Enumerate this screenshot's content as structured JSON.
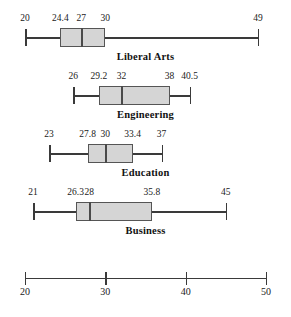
{
  "header": {
    "clipped_text": ""
  },
  "chart_data": {
    "type": "boxplot",
    "title": "",
    "xlabel": "",
    "ylabel": "",
    "xlim": [
      20,
      50
    ],
    "grid": false,
    "legend": "none",
    "axis": {
      "ticks": [
        20,
        30,
        40,
        50
      ],
      "tick_labels": [
        "20",
        "30",
        "40",
        "50"
      ]
    },
    "categories": [
      "Liberal Arts",
      "Engineering",
      "Education",
      "Business"
    ],
    "boxes": [
      {
        "label": "Liberal Arts",
        "min": 20,
        "q1": 24.4,
        "median": 27,
        "q3": 30,
        "max": 49,
        "labels": [
          "20",
          "24.4",
          "27",
          "30",
          "49"
        ]
      },
      {
        "label": "Engineering",
        "min": 26,
        "q1": 29.2,
        "median": 32,
        "q3": 38,
        "max": 40.5,
        "labels": [
          "26",
          "29.2",
          "32",
          "38",
          "40.5"
        ]
      },
      {
        "label": "Education",
        "min": 23,
        "q1": 27.8,
        "median": 30,
        "q3": 33.4,
        "max": 37,
        "labels": [
          "23",
          "27.8",
          "30",
          "33.4",
          "37"
        ]
      },
      {
        "label": "Business",
        "min": 21,
        "q1": 26.3,
        "median": 28,
        "q3": 35.8,
        "max": 45,
        "labels": [
          "21",
          "26.3",
          "28",
          "35.8",
          "45"
        ]
      }
    ],
    "colors": {
      "box_fill": "#d5d5d5",
      "box_border": "#555555",
      "line": "#3a3a3a",
      "text": "#1a1a1a"
    }
  }
}
